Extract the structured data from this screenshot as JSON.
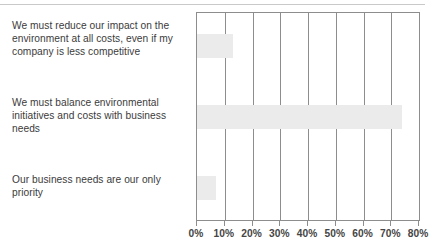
{
  "chart_data": {
    "type": "bar",
    "orientation": "horizontal",
    "title": "",
    "subtitle": "",
    "xlabel": "",
    "ylabel": "",
    "xlim": [
      0,
      80
    ],
    "ylim": null,
    "grid": true,
    "grid_axis": "x",
    "legend": false,
    "legend_position": "none",
    "value_unit": "%",
    "categories": [
      "We must reduce our impact on the environment at all costs, even if my company is less competitive",
      "We must balance environmental initiatives and costs with business needs",
      "Our business needs are our only priority"
    ],
    "values": [
      13,
      74,
      7
    ],
    "xticks": [
      0,
      10,
      20,
      30,
      40,
      50,
      60,
      70,
      80
    ],
    "xticklabels": [
      "0%",
      "10%",
      "20%",
      "30%",
      "40%",
      "50%",
      "60%",
      "70%",
      "80%"
    ],
    "series": [
      {
        "name": "",
        "values": [
          13,
          74,
          7
        ]
      }
    ],
    "annotations": []
  },
  "style": {
    "bar_fill": "#ebebeb",
    "axis_line": "#8d8d8d",
    "grid_color": "#8d8d8d",
    "label_text": "#3b3b3b",
    "tick_text": "#454545",
    "background": "#ffffff",
    "top_rule": "#c9c9c9"
  },
  "labels": {
    "row_0": "We must reduce our impact on the environment at all costs, even if my company is less competitive",
    "row_1": "We must balance environmental initiatives and costs with business needs",
    "row_2": "Our business needs are our only priority"
  }
}
